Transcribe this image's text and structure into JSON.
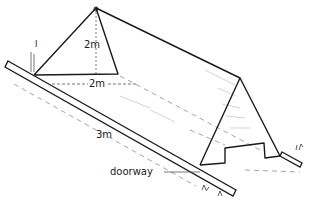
{
  "diagram": {
    "labels": {
      "height": "2m",
      "width": "2m",
      "length": "3m",
      "doorway": "doorway",
      "peg_mark": "l"
    },
    "colors": {
      "line": "#1a1a1a",
      "dashed": "#9a9a9a",
      "shade": "#bdbdbd",
      "background": "#ffffff"
    }
  }
}
